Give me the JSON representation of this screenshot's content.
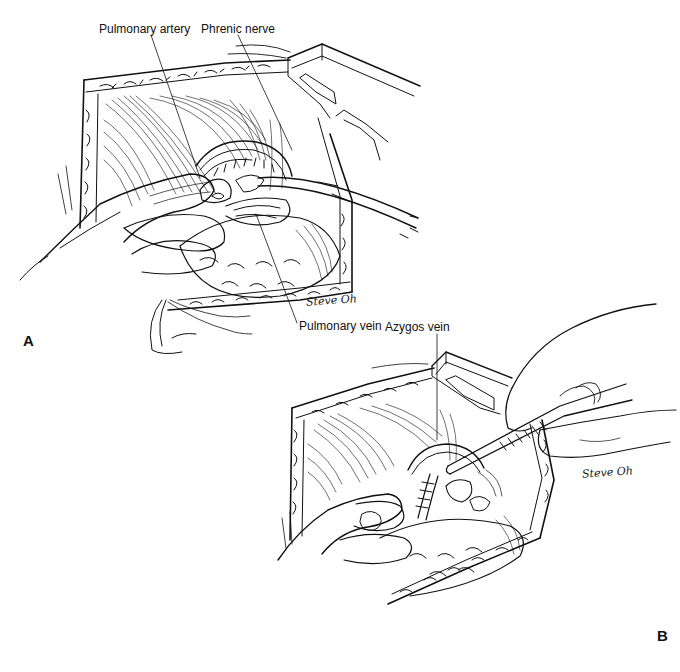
{
  "figure": {
    "panels": [
      {
        "id": "A",
        "panel_label": "A",
        "labels": {
          "pulmonary_artery": "Pulmonary artery",
          "phrenic_nerve": "Phrenic nerve",
          "pulmonary_vein": "Pulmonary vein"
        },
        "signature": "Steve Oh"
      },
      {
        "id": "B",
        "panel_label": "B",
        "labels": {
          "azygos_vein": "Azygos vein"
        },
        "signature": "Steve Oh"
      }
    ]
  },
  "colors": {
    "ink": "#111111",
    "background": "#ffffff"
  }
}
